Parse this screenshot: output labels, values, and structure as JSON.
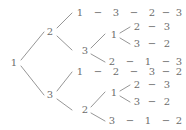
{
  "diagram": {
    "root_label": "1",
    "line_color": "#8a8a8a",
    "text_color": "#6d6d6d",
    "background": "#ffffff",
    "separator": "−",
    "nodes": {
      "root": "1",
      "b1": "2",
      "b2": "3",
      "b1_c1": "1",
      "b1_c2": "3",
      "b1_c2_d1": "1",
      "b1_c2_d2": "2",
      "b2_c1": "1",
      "b2_c2": "2",
      "b2_c2_d1": "1",
      "b2_c2_d2": "3"
    },
    "paths": [
      {
        "id": "p1",
        "values": [
          "1",
          "3",
          "2",
          "3"
        ]
      },
      {
        "id": "p2",
        "values": [
          "1",
          "2",
          "3"
        ]
      },
      {
        "id": "p3",
        "values": [
          "1",
          "3",
          "2"
        ]
      },
      {
        "id": "p4",
        "values": [
          "2",
          "1",
          "3"
        ]
      },
      {
        "id": "p5",
        "values": [
          "1",
          "2",
          "3",
          "2"
        ]
      },
      {
        "id": "p6",
        "values": [
          "1",
          "2",
          "3"
        ]
      },
      {
        "id": "p7",
        "values": [
          "1",
          "3",
          "2"
        ]
      },
      {
        "id": "p8",
        "values": [
          "3",
          "1",
          "2"
        ]
      }
    ],
    "rows": [
      {
        "row": 1,
        "tokens": [
          "1",
          "−",
          "3",
          "−",
          "2",
          "−",
          "3"
        ]
      },
      {
        "row": 2,
        "tokens": [
          "1",
          "<",
          "2",
          "−",
          "3"
        ]
      },
      {
        "row": 3,
        "tokens": [
          "3",
          "−",
          "2"
        ]
      },
      {
        "row": 4,
        "tokens": [
          "2",
          "−",
          "1",
          "−",
          "3"
        ]
      },
      {
        "row": 5,
        "tokens": [
          "1",
          "−",
          "2",
          "−",
          "3",
          "−",
          "2"
        ]
      },
      {
        "row": 6,
        "tokens": [
          "1",
          "<",
          "2",
          "−",
          "3"
        ]
      },
      {
        "row": 7,
        "tokens": [
          "3",
          "−",
          "2"
        ]
      },
      {
        "row": 8,
        "tokens": [
          "3",
          "−",
          "1",
          "−",
          "2"
        ]
      }
    ],
    "labels": {
      "root": "1",
      "lvl1_top": "2",
      "lvl1_bottom": "3",
      "top_r1_c1": "1",
      "top_r1_c2": "3",
      "top_r1_c3": "2",
      "top_r1_c4": "3",
      "top_r2_c1": "3",
      "top_r2_inner": "1",
      "top_r2_a1": "2",
      "top_r2_a2": "3",
      "top_r3_a1": "3",
      "top_r3_a2": "2",
      "top_r4_c1": "2",
      "top_r4_c2": "1",
      "top_r4_c3": "3",
      "bot_r1_c1": "1",
      "bot_r1_c2": "2",
      "bot_r1_c3": "3",
      "bot_r1_c4": "2",
      "bot_r2_c1": "2",
      "bot_r2_inner": "1",
      "bot_r2_a1": "2",
      "bot_r2_a2": "3",
      "bot_r3_a1": "3",
      "bot_r3_a2": "2",
      "bot_r4_c1": "3",
      "bot_r4_c2": "1",
      "bot_r4_c3": "2",
      "dash": "−"
    }
  }
}
